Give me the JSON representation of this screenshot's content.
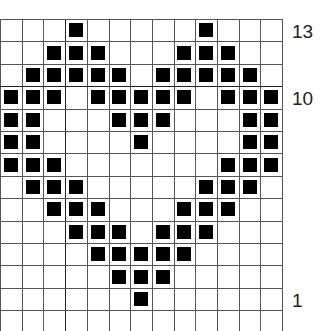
{
  "chart": {
    "title": "",
    "columns": 13,
    "rows_visible": 13,
    "cell_color": "#000000",
    "grid_color": "#555555",
    "background": "#ffffff",
    "row_labels": [
      {
        "row": 13,
        "text": "13"
      },
      {
        "row": 10,
        "text": "10"
      },
      {
        "row": 1,
        "text": "1"
      }
    ],
    "filled": {
      "13": [
        3,
        9
      ],
      "12": [
        2,
        3,
        4,
        8,
        9,
        10
      ],
      "11": [
        1,
        2,
        3,
        4,
        5,
        7,
        8,
        9,
        10,
        11
      ],
      "10": [
        0,
        1,
        2,
        4,
        5,
        6,
        7,
        8,
        10,
        11,
        12
      ],
      "9": [
        0,
        1,
        5,
        6,
        7,
        11,
        12
      ],
      "8": [
        0,
        1,
        6,
        11,
        12
      ],
      "7": [
        0,
        1,
        2,
        10,
        11,
        12
      ],
      "6": [
        1,
        2,
        3,
        9,
        10,
        11
      ],
      "5": [
        2,
        3,
        4,
        8,
        9,
        10
      ],
      "4": [
        3,
        4,
        5,
        7,
        8,
        9
      ],
      "3": [
        4,
        5,
        6,
        7,
        8
      ],
      "2": [
        5,
        6,
        7
      ],
      "1": [
        6
      ]
    }
  }
}
